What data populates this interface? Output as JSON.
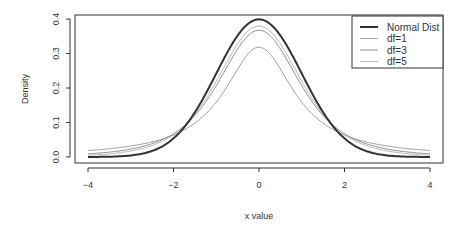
{
  "chart_data": {
    "type": "line",
    "title": "",
    "xlabel": "x value",
    "ylabel": "Density",
    "xlim": [
      -4,
      4
    ],
    "ylim": [
      0,
      0.4
    ],
    "x_ticks": [
      "-4",
      "-2",
      "0",
      "2",
      "4"
    ],
    "y_ticks": [
      "0.0",
      "0.1",
      "0.2",
      "0.3",
      "0.4"
    ],
    "grid": false,
    "legend_position": "top-right",
    "series": [
      {
        "name": "Normal Dist",
        "dist": "normal",
        "df": null,
        "color": "#333333",
        "width": 2,
        "peak": 0.399
      },
      {
        "name": "df=1",
        "dist": "t",
        "df": 1,
        "color": "#a0a0a0",
        "width": 1,
        "peak": 0.318
      },
      {
        "name": "df=3",
        "dist": "t",
        "df": 3,
        "color": "#909090",
        "width": 1,
        "peak": 0.368
      },
      {
        "name": "df=5",
        "dist": "t",
        "df": 5,
        "color": "#b8b8b8",
        "width": 1,
        "peak": 0.38
      }
    ]
  }
}
